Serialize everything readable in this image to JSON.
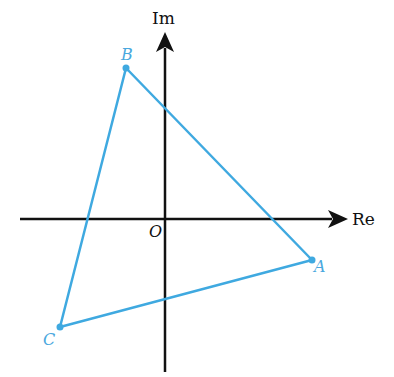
{
  "diagram": {
    "axes": {
      "real_label": "Re",
      "imag_label": "Im",
      "origin_label": "O",
      "color": "#111111"
    },
    "triangle": {
      "color": "#3fa9e0",
      "vertices": [
        {
          "name": "A",
          "x": 312,
          "y": 260
        },
        {
          "name": "B",
          "x": 126,
          "y": 68
        },
        {
          "name": "C",
          "x": 60,
          "y": 327
        }
      ]
    }
  }
}
